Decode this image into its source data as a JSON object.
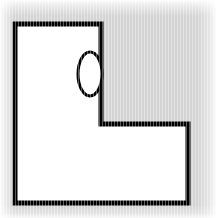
{
  "figure": {
    "canvas": {
      "width": 216,
      "height": 218,
      "background_color": "#d4d4d4",
      "edge_wash_color": "#ffffff",
      "texture": "fine vertical scan stripes"
    },
    "shapes": [
      {
        "name": "l-shape-polygon",
        "type": "polygon",
        "fill_color": "#ffffff",
        "stroke_color": "#000000",
        "stroke_width": 5,
        "points": "15,24 101,24 101,124 188,124 188,203 15,203",
        "vertices": [
          [
            15,
            24
          ],
          [
            101,
            24
          ],
          [
            101,
            124
          ],
          [
            188,
            124
          ],
          [
            188,
            203
          ],
          [
            15,
            203
          ]
        ],
        "vertex_count": 6,
        "description": "Capital-letter L outline: tall vertical arm on the left, short horizontal foot extending to the right along the bottom."
      },
      {
        "name": "ellipse-marker",
        "type": "ellipse",
        "fill_color": "#ffffff",
        "stroke_color": "#000000",
        "stroke_width": 3,
        "center_x": 90,
        "center_y": 74,
        "radius_x": 12,
        "radius_y": 22,
        "bounds": [
          78,
          52,
          102,
          96
        ],
        "description": "Tall narrow vertical ellipse straddling the right-hand edge of the L's vertical arm, near the upper portion."
      }
    ]
  }
}
